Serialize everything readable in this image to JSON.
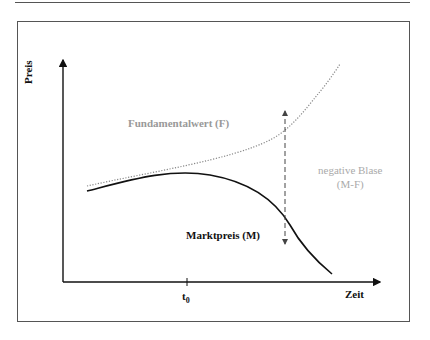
{
  "diagram": {
    "axes": {
      "y_label": "Preis",
      "x_label": "Zeit",
      "x_tick": {
        "base": "t",
        "sub": "0"
      }
    },
    "curves": [
      {
        "name": "Fundamentalwert (F)",
        "style": "dotted",
        "color": "#999999"
      },
      {
        "name": "Marktpreis (M)",
        "style": "solid",
        "color": "#111111"
      }
    ],
    "annotation": {
      "line1": "negative Blase",
      "line2": "(M-F)",
      "color": "#aaaaaa"
    }
  }
}
